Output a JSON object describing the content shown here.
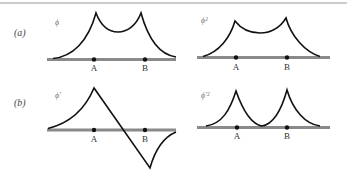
{
  "figure": {
    "row_labels": {
      "a": "(a)",
      "b": "(b)"
    },
    "panels": [
      {
        "id": "a-left",
        "row": "a",
        "function_label": "ϕ",
        "points": [
          "A",
          "B"
        ],
        "description": "twin cusped peaks above A and B, decaying to the axis"
      },
      {
        "id": "a-right",
        "row": "a",
        "function_label": "ϕ²",
        "points": [
          "A",
          "B"
        ],
        "description": "squared profile, cusped peaks above A and B"
      },
      {
        "id": "b-left",
        "row": "b",
        "function_label": "ϕ′",
        "points": [
          "A",
          "B"
        ],
        "description": "derivative: positive cusp at A, linear drop crossing axis, negative cusp past B"
      },
      {
        "id": "b-right",
        "row": "b",
        "function_label": "ϕ′²",
        "points": [
          "A",
          "B"
        ],
        "description": "squared derivative: two cusped peaks at A and B, touching axis between"
      }
    ],
    "colors": {
      "curve": "#111111",
      "axis": "#8a8a8a",
      "background": "#ffffff"
    }
  }
}
